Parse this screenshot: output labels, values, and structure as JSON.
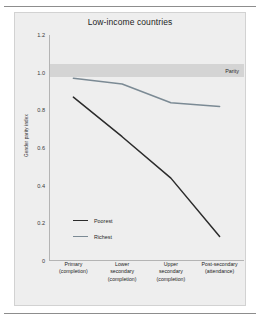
{
  "chart_data": {
    "type": "line",
    "title": "Low-income countries",
    "xlabel": "",
    "ylabel": "Gender parity index",
    "categories": [
      "Primary (completion)",
      "Lower secondary (completion)",
      "Upper secondary (completion)",
      "Post-secondary (attendance)"
    ],
    "category_lines": [
      [
        "Primary",
        "(completion)"
      ],
      [
        "Lower",
        "secondary",
        "(completion)"
      ],
      [
        "Upper",
        "secondary",
        "(completion)"
      ],
      [
        "Post-secondary",
        "(attendance)"
      ]
    ],
    "series": [
      {
        "name": "Poorest",
        "values": [
          0.87,
          0.66,
          0.44,
          0.13
        ],
        "color": "#2b2b2b"
      },
      {
        "name": "Richest",
        "values": [
          0.97,
          0.94,
          0.84,
          0.82
        ],
        "color": "#7b8a94"
      }
    ],
    "ylim": [
      0,
      1.2
    ],
    "yticks": [
      0,
      0.2,
      0.4,
      0.6,
      0.8,
      1.0,
      1.2
    ],
    "ytick_labels": [
      "0",
      "0.2",
      "0.4",
      "0.6",
      "0.8",
      "1.0",
      "1.2"
    ],
    "annotations": [
      {
        "name": "parity",
        "label": "Parity",
        "value": 1.0,
        "band": [
          0.975,
          1.045
        ],
        "color": "#d4d4d4"
      }
    ],
    "grid": false,
    "legend_position": "inside-lower-left",
    "panel_background": "#eeeeee"
  }
}
